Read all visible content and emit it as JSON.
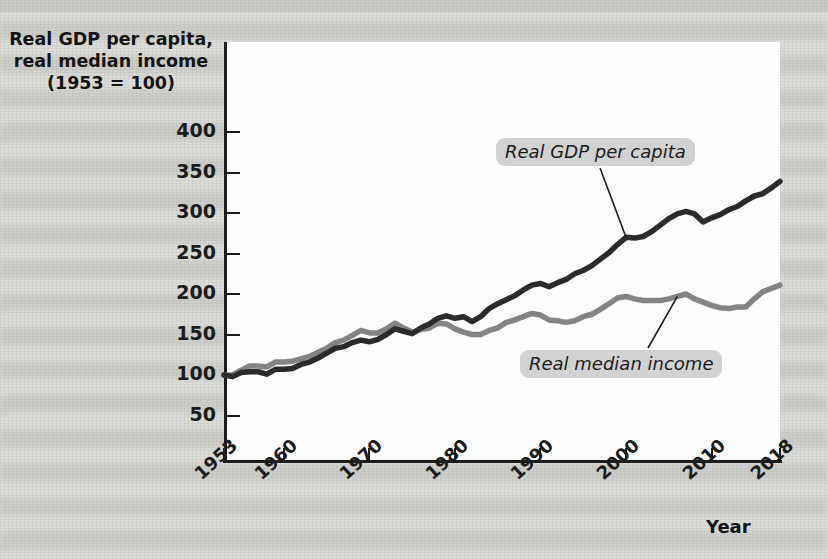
{
  "figure": {
    "y_axis_title": "Real GDP per capita,\nreal median income\n(1953 = 100)",
    "y_axis_title_line1": "Real GDP per capita,",
    "y_axis_title_line2": "real median income",
    "y_axis_title_line3": "(1953 = 100)",
    "x_axis_title": "Year",
    "series_label_gdp": "Real GDP per capita",
    "series_label_income": "Real median income",
    "colors": {
      "gdp_line": "#2b2b2b",
      "income_line": "#848484",
      "axis": "#1d1d1d",
      "plot_background": "#fdfdfd",
      "page_background": "#dcdcd8",
      "callout_background": "#d2d2d2"
    }
  },
  "chart_data": {
    "type": "line",
    "title": "",
    "xlabel": "Year",
    "ylabel": "Real GDP per capita, real median income (1953 = 100)",
    "xlim": [
      1953,
      2018
    ],
    "ylim": [
      0,
      420
    ],
    "yticks": [
      50,
      100,
      150,
      200,
      250,
      300,
      350,
      400
    ],
    "xticks": [
      1953,
      1960,
      1970,
      1980,
      1990,
      2000,
      2010,
      2018
    ],
    "xtick_labels": [
      "1953",
      "1960",
      "1970",
      "1980",
      "1990",
      "2000",
      "2010",
      "2018"
    ],
    "ytick_labels": [
      "50",
      "100",
      "150",
      "200",
      "250",
      "300",
      "350",
      "400"
    ],
    "grid": false,
    "legend": "annotated-callouts",
    "x": [
      1953,
      1954,
      1955,
      1956,
      1957,
      1958,
      1959,
      1960,
      1961,
      1962,
      1963,
      1964,
      1965,
      1966,
      1967,
      1968,
      1969,
      1970,
      1971,
      1972,
      1973,
      1974,
      1975,
      1976,
      1977,
      1978,
      1979,
      1980,
      1981,
      1982,
      1983,
      1984,
      1985,
      1986,
      1987,
      1988,
      1989,
      1990,
      1991,
      1992,
      1993,
      1994,
      1995,
      1996,
      1997,
      1998,
      1999,
      2000,
      2001,
      2002,
      2003,
      2004,
      2005,
      2006,
      2007,
      2008,
      2009,
      2010,
      2011,
      2012,
      2013,
      2014,
      2015,
      2016,
      2017,
      2018
    ],
    "series": [
      {
        "name": "Real GDP per capita",
        "color": "#2b2b2b",
        "values": [
          100,
          98,
          103,
          104,
          104,
          101,
          107,
          107,
          108,
          113,
          116,
          121,
          127,
          133,
          135,
          140,
          143,
          141,
          144,
          150,
          157,
          154,
          151,
          158,
          163,
          170,
          173,
          170,
          172,
          166,
          172,
          182,
          188,
          193,
          198,
          205,
          211,
          213,
          209,
          214,
          218,
          225,
          229,
          235,
          243,
          251,
          261,
          270,
          269,
          271,
          277,
          285,
          293,
          299,
          302,
          299,
          289,
          294,
          298,
          304,
          308,
          315,
          321,
          324,
          331,
          339
        ]
      },
      {
        "name": "Real median income",
        "color": "#848484",
        "values": [
          100,
          100,
          106,
          111,
          111,
          110,
          116,
          116,
          117,
          120,
          123,
          128,
          133,
          140,
          143,
          149,
          155,
          152,
          152,
          157,
          164,
          158,
          153,
          156,
          158,
          164,
          163,
          157,
          153,
          150,
          150,
          155,
          158,
          165,
          168,
          172,
          176,
          174,
          168,
          167,
          165,
          167,
          172,
          175,
          181,
          188,
          195,
          197,
          194,
          192,
          192,
          192,
          194,
          197,
          200,
          194,
          190,
          186,
          183,
          182,
          184,
          184,
          194,
          203,
          207,
          211
        ]
      }
    ],
    "notes": [
      "Both series indexed so that 1953 = 100.",
      "Real median income runs above real GDP per capita from the mid-1950s until about 1983, then falls persistently below it.",
      "Both series show a sharp dip during the 2008-2009 recession."
    ]
  }
}
